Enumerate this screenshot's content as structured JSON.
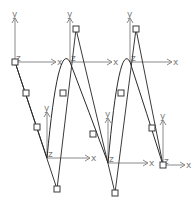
{
  "diagram": {
    "title": "",
    "colors": {
      "background": "#ffffff",
      "axis": "#8a8a8a",
      "curve": "#2a2a2a",
      "handle": "#3a3a3a"
    },
    "axis_labels": {
      "x": "x",
      "y": "y",
      "z": "z"
    },
    "frames": [
      {
        "id": "frame-1",
        "origin": [
          15,
          62
        ],
        "y_end": [
          15,
          18
        ],
        "x_end": [
          56,
          62
        ]
      },
      {
        "id": "frame-2",
        "origin": [
          70,
          62
        ],
        "y_end": [
          70,
          18
        ],
        "x_end": [
          112,
          62
        ]
      },
      {
        "id": "frame-3",
        "origin": [
          130,
          62
        ],
        "y_end": [
          130,
          18
        ],
        "x_end": [
          172,
          62
        ]
      },
      {
        "id": "frame-4",
        "origin": [
          47,
          158
        ],
        "y_end": [
          47,
          112
        ],
        "x_end": [
          90,
          158
        ]
      },
      {
        "id": "frame-5",
        "origin": [
          108,
          163
        ],
        "y_end": [
          108,
          118
        ],
        "x_end": [
          148,
          163
        ]
      },
      {
        "id": "frame-6",
        "origin": [
          163,
          165
        ],
        "y_end": [
          163,
          120
        ],
        "x_end": [
          185,
          165
        ]
      }
    ],
    "control_lines": [
      {
        "from": [
          15,
          62
        ],
        "to": [
          57,
          189
        ]
      },
      {
        "from": [
          76,
          29
        ],
        "to": [
          57,
          189
        ]
      },
      {
        "from": [
          76,
          29
        ],
        "to": [
          115,
          193
        ]
      },
      {
        "from": [
          136,
          29
        ],
        "to": [
          115,
          193
        ]
      },
      {
        "from": [
          136,
          29
        ],
        "to": [
          163,
          165
        ]
      }
    ],
    "handles": [
      [
        15,
        62
      ],
      [
        26,
        93
      ],
      [
        37,
        127
      ],
      [
        57,
        189
      ],
      [
        76,
        29
      ],
      [
        63,
        93
      ],
      [
        93,
        134
      ],
      [
        115,
        193
      ],
      [
        136,
        29
      ],
      [
        121,
        93
      ],
      [
        152,
        128
      ],
      [
        163,
        165
      ]
    ],
    "curve_segments": [
      "M15,62 Q31,110 47,158",
      "M47,158 Q58,40 70,62",
      "M70,62 Q89,112 108,163",
      "M108,163 Q119,40 130,62",
      "M130,62 Q147,114 163,165"
    ]
  }
}
